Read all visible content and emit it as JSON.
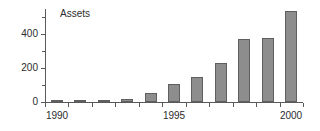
{
  "chart_data": {
    "type": "bar",
    "title": "Assets",
    "xlabel": "",
    "ylabel": "",
    "categories": [
      "1990",
      "1991",
      "1992",
      "1993",
      "1994",
      "1995",
      "1996",
      "1997",
      "1998",
      "1999",
      "2000"
    ],
    "values": [
      5,
      8,
      12,
      20,
      55,
      105,
      145,
      228,
      370,
      378,
      535
    ],
    "ylim": [
      0,
      560
    ],
    "yticks": [
      0,
      200,
      400
    ],
    "ytick_labels": [
      "0",
      "200",
      "400"
    ],
    "yticks_minor": [
      100,
      300,
      500
    ],
    "xtick_labels_shown": [
      "1990",
      "1995",
      "2000"
    ],
    "grid": false,
    "legend": false,
    "bar_color": "#8d8d8d",
    "bar_edge_color": "#5f5f5f",
    "axis_color": "#5a5a5a",
    "text_color": "#2b2b2b",
    "background": "#ffffff"
  }
}
